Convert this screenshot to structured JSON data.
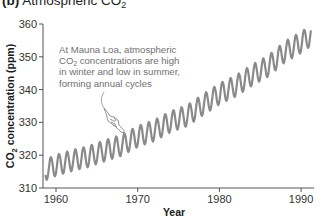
{
  "title": {
    "panel": "(b)",
    "text": "Atmospheric CO",
    "subscript": "2"
  },
  "annotation": {
    "lines": [
      "At Mauna Loa, atmospheric",
      "CO|2| concentrations are high",
      "in winter and low in summer,",
      "forming annual cycles"
    ],
    "icon": "pointing-hand-icon"
  },
  "colors": {
    "curve": "#8a8a8a",
    "axis": "#555555",
    "annotation_text": "#707070"
  },
  "chart_data": {
    "type": "line",
    "title": "Atmospheric CO2",
    "xlabel": "Year",
    "ylabel": "CO2 concentration (ppm)",
    "xlim": [
      1958.3,
      1992.6
    ],
    "ylim": [
      310,
      360
    ],
    "xticks": [
      1960,
      1970,
      1980,
      1990
    ],
    "yticks": [
      310,
      320,
      330,
      340,
      350,
      360
    ],
    "grid": false,
    "legend": null,
    "annotation": "At Mauna Loa, atmospheric CO2 concentrations are high in winter and low in summer, forming annual cycles",
    "seasonal_amplitude_ppm": 3.2,
    "series": [
      {
        "name": "Mauna Loa monthly CO2 (annual mean trend + seasonal cycle)",
        "x": [
          1958.7,
          1960,
          1962,
          1964,
          1966,
          1968,
          1970,
          1972,
          1974,
          1976,
          1978,
          1980,
          1982,
          1984,
          1986,
          1988,
          1990,
          1991.2
        ],
        "annual_mean": [
          315.5,
          316.9,
          318.4,
          319.6,
          321.4,
          323.0,
          325.7,
          327.5,
          330.2,
          332.0,
          335.4,
          338.7,
          341.1,
          344.4,
          347.2,
          351.5,
          354.4,
          356.5
        ]
      }
    ]
  },
  "axes": {
    "x_title": "Year",
    "y_title_main": "CO",
    "y_title_sub": "2",
    "y_title_rest": " concentration (ppm)",
    "x_tick_labels": [
      "1960",
      "1970",
      "1980",
      "1990"
    ],
    "y_tick_labels": [
      "310",
      "320",
      "330",
      "340",
      "350",
      "360"
    ]
  }
}
